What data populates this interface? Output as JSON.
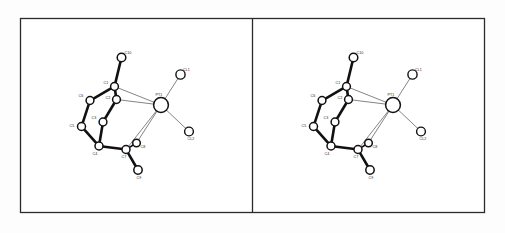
{
  "figure": {
    "panel_count": 2,
    "background_color": "#fdfdfd",
    "frame_color": "#2b2b2b",
    "bond_cage_color": "#111111",
    "bond_metal_color": "#6e6e6e",
    "atom_fill_color": "#ffffff"
  },
  "panels": [
    {
      "name": "left-eye-view",
      "offset_x": 0
    },
    {
      "name": "right-eye-view",
      "offset_x": 232
    }
  ],
  "labels": {
    "pt1": "PT1",
    "cl1": "CL1",
    "cl2": "CL2",
    "c1": "C1",
    "c2": "C2",
    "c3": "C3",
    "c4": "C4",
    "c5": "C5",
    "c6": "C6",
    "c7": "C7",
    "c8": "C8",
    "c9": "C9",
    "c10": "C10"
  },
  "chart_data": {
    "type": "scatter",
    "xlabel": "",
    "ylabel": "",
    "atoms": [
      {
        "id": "PT1",
        "label": "PT1",
        "x": 161.0,
        "y": 105.0,
        "r": 7.4,
        "kind": "metal",
        "label_dx": -2.0,
        "label_dy": -9.5
      },
      {
        "id": "CL1",
        "label": "CL1",
        "x": 180.5,
        "y": 74.5,
        "r": 4.6,
        "kind": "ligand",
        "label_dx": 6.0,
        "label_dy": -4.0
      },
      {
        "id": "CL2",
        "label": "CL2",
        "x": 189.0,
        "y": 131.5,
        "r": 4.4,
        "kind": "ligand",
        "label_dx": 2.0,
        "label_dy": 8.5
      },
      {
        "id": "C1",
        "label": "C1",
        "x": 114.5,
        "y": 86.5,
        "r": 3.9,
        "kind": "carbon",
        "label_dx": -8.5,
        "label_dy": -3.0
      },
      {
        "id": "C2",
        "label": "C2",
        "x": 116.5,
        "y": 99.5,
        "r": 3.9,
        "kind": "carbon",
        "label_dx": -8.5,
        "label_dy": -1.0
      },
      {
        "id": "C3",
        "label": "C3",
        "x": 103.0,
        "y": 122.0,
        "r": 3.9,
        "kind": "carbon",
        "label_dx": -9.0,
        "label_dy": -3.5
      },
      {
        "id": "C4",
        "label": "C4",
        "x": 99.0,
        "y": 146.0,
        "r": 4.0,
        "kind": "carbon",
        "label_dx": -4.0,
        "label_dy": 8.5
      },
      {
        "id": "C5",
        "label": "C5",
        "x": 81.5,
        "y": 126.5,
        "r": 4.0,
        "kind": "carbon",
        "label_dx": -9.5,
        "label_dy": 0.5
      },
      {
        "id": "C6",
        "label": "C6",
        "x": 90.0,
        "y": 100.5,
        "r": 3.9,
        "kind": "carbon",
        "label_dx": -9.0,
        "label_dy": -3.5
      },
      {
        "id": "C7",
        "label": "C7",
        "x": 126.0,
        "y": 149.5,
        "r": 4.0,
        "kind": "carbon",
        "label_dx": -2.0,
        "label_dy": 8.5
      },
      {
        "id": "C8",
        "label": "C8",
        "x": 136.5,
        "y": 143.0,
        "r": 3.8,
        "kind": "carbon",
        "label_dx": 6.5,
        "label_dy": 4.5
      },
      {
        "id": "C9",
        "label": "C9",
        "x": 138.0,
        "y": 170.0,
        "r": 4.2,
        "kind": "carbon",
        "label_dx": 1.0,
        "label_dy": 8.5
      },
      {
        "id": "C10",
        "label": "C10",
        "x": 121.5,
        "y": 57.5,
        "r": 4.3,
        "kind": "carbon",
        "label_dx": 6.5,
        "label_dy": -3.5
      }
    ],
    "bonds": [
      {
        "from": "C1",
        "to": "C10",
        "style": "cage"
      },
      {
        "from": "C1",
        "to": "C2",
        "style": "cage"
      },
      {
        "from": "C1",
        "to": "C6",
        "style": "cage"
      },
      {
        "from": "C2",
        "to": "C3",
        "style": "cage"
      },
      {
        "from": "C3",
        "to": "C4",
        "style": "cage"
      },
      {
        "from": "C4",
        "to": "C5",
        "style": "cage"
      },
      {
        "from": "C5",
        "to": "C6",
        "style": "cage"
      },
      {
        "from": "C4",
        "to": "C7",
        "style": "cage"
      },
      {
        "from": "C7",
        "to": "C8",
        "style": "cage-thin"
      },
      {
        "from": "C7",
        "to": "C9",
        "style": "cage"
      },
      {
        "from": "PT1",
        "to": "CL1",
        "style": "metal"
      },
      {
        "from": "PT1",
        "to": "CL2",
        "style": "metal"
      },
      {
        "from": "PT1",
        "to": "C1",
        "style": "metal"
      },
      {
        "from": "PT1",
        "to": "C2",
        "style": "metal"
      },
      {
        "from": "PT1",
        "to": "C7",
        "style": "metal"
      },
      {
        "from": "PT1",
        "to": "C8",
        "style": "metal"
      }
    ]
  }
}
